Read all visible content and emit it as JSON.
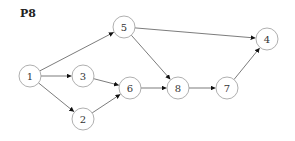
{
  "title": "P8",
  "colors": {
    "edge": "#444444",
    "node_stroke": "#9a9a9a",
    "node_fill": "#ffffff",
    "text": "#333333"
  },
  "nodes": [
    {
      "id": "1",
      "label": "1",
      "x": 30,
      "y": 76
    },
    {
      "id": "5",
      "label": "5",
      "x": 124,
      "y": 27
    },
    {
      "id": "3",
      "label": "3",
      "x": 83,
      "y": 76
    },
    {
      "id": "6",
      "label": "6",
      "x": 130,
      "y": 88
    },
    {
      "id": "2",
      "label": "2",
      "x": 83,
      "y": 119
    },
    {
      "id": "8",
      "label": "8",
      "x": 178,
      "y": 88
    },
    {
      "id": "7",
      "label": "7",
      "x": 227,
      "y": 88
    },
    {
      "id": "4",
      "label": "4",
      "x": 267,
      "y": 39
    }
  ],
  "edges": [
    {
      "from": "1",
      "to": "5"
    },
    {
      "from": "1",
      "to": "3"
    },
    {
      "from": "1",
      "to": "2"
    },
    {
      "from": "3",
      "to": "6"
    },
    {
      "from": "2",
      "to": "6"
    },
    {
      "from": "5",
      "to": "4"
    },
    {
      "from": "5",
      "to": "8"
    },
    {
      "from": "6",
      "to": "8"
    },
    {
      "from": "8",
      "to": "7"
    },
    {
      "from": "7",
      "to": "4"
    }
  ]
}
